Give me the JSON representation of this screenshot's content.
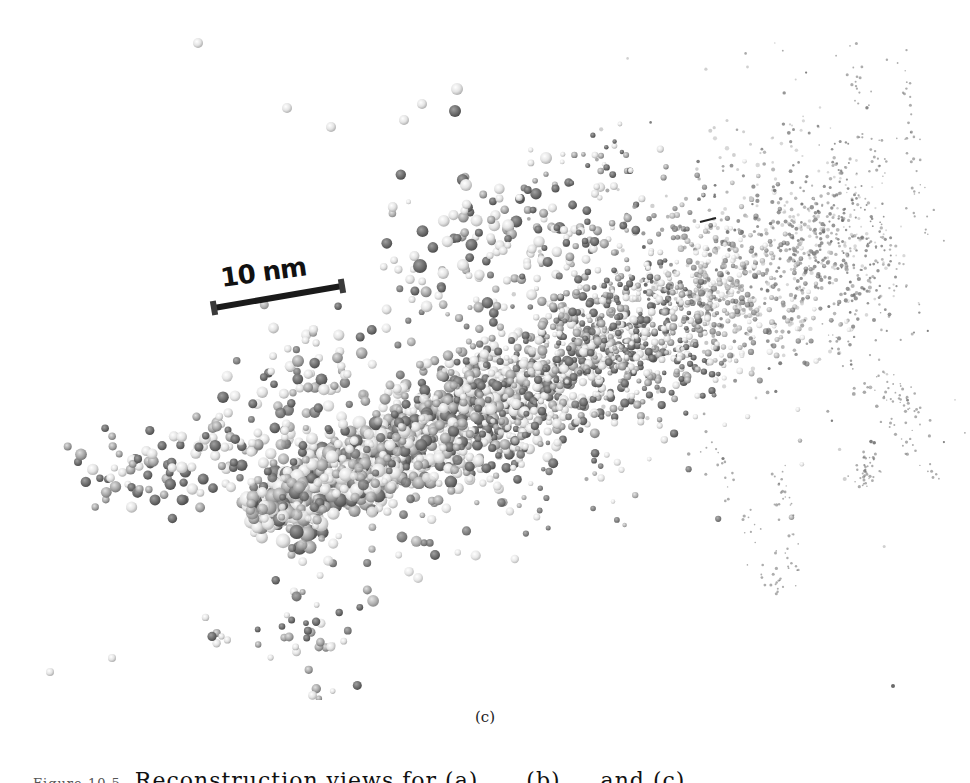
{
  "figure": {
    "subfigure_label": "(c)",
    "scale_bar": {
      "label": "10 nm",
      "x1": 214,
      "y1": 308,
      "x2": 342,
      "y2": 286,
      "color": "#1a1a1a"
    },
    "colors": {
      "light_particle": "#e6e6e6",
      "mid_particle": "#a8a8a8",
      "dark_particle": "#6e6e6e",
      "background": "#ffffff"
    },
    "cloud": {
      "description": "3D rendering of scattered spherical particles along a diagonal track, larger near lower-left, fading to fine dots at upper-right",
      "track_start": [
        255,
        520
      ],
      "track_end": [
        880,
        215
      ],
      "seed": 7
    },
    "isolated_particles": [
      {
        "x": 198,
        "y": 43,
        "r": 5,
        "tone": "light"
      },
      {
        "x": 287,
        "y": 108,
        "r": 5,
        "tone": "light"
      },
      {
        "x": 331,
        "y": 127,
        "r": 5,
        "tone": "light"
      },
      {
        "x": 404,
        "y": 120,
        "r": 5,
        "tone": "light"
      },
      {
        "x": 422,
        "y": 104,
        "r": 5,
        "tone": "light"
      },
      {
        "x": 457,
        "y": 89,
        "r": 6,
        "tone": "light"
      },
      {
        "x": 455,
        "y": 111,
        "r": 6,
        "tone": "dark"
      },
      {
        "x": 546,
        "y": 158,
        "r": 6,
        "tone": "light"
      },
      {
        "x": 466,
        "y": 185,
        "r": 6,
        "tone": "light"
      },
      {
        "x": 50,
        "y": 672,
        "r": 4,
        "tone": "light"
      },
      {
        "x": 112,
        "y": 658,
        "r": 4,
        "tone": "light"
      },
      {
        "x": 420,
        "y": 266,
        "r": 7,
        "tone": "dark"
      },
      {
        "x": 435,
        "y": 555,
        "r": 5,
        "tone": "dark"
      },
      {
        "x": 893,
        "y": 686,
        "r": 2,
        "tone": "dark"
      }
    ]
  },
  "caption": {
    "figure_number": "Figure 10.5",
    "text": "Reconstruction views for (a) ..., (b) ... and (c) ..."
  }
}
